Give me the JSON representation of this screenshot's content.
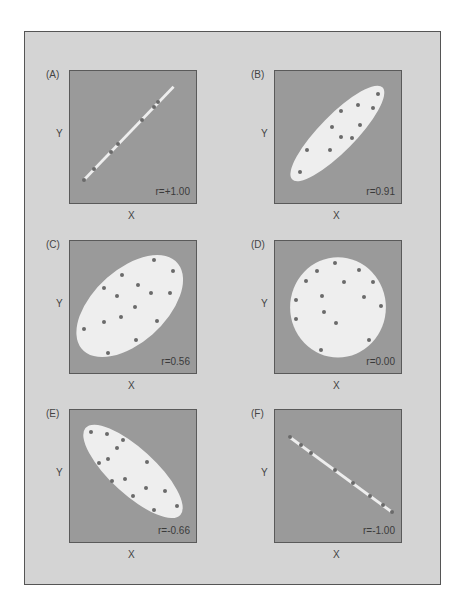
{
  "figure": {
    "colors": {
      "frame_bg": "#d4d4d4",
      "plot_bg": "#9a9a9a",
      "region_fill": "#eeeeee",
      "dot": "#6a6a6a"
    }
  },
  "chart_data": [
    {
      "type": "scatter",
      "panel": "(A)",
      "xlabel": "X",
      "ylabel": "Y",
      "annotation": "r=+1.00",
      "r": 1.0,
      "region": {
        "shape": "line",
        "x1": 11,
        "y1": 82.6,
        "x2": 82.2,
        "y2": 11.9
      },
      "points": [
        [
          11,
          82.6
        ],
        [
          19.4,
          74.1
        ],
        [
          32.7,
          61.2
        ],
        [
          38,
          55.2
        ],
        [
          57.3,
          37.3
        ],
        [
          66.5,
          26.9
        ],
        [
          70.2,
          23.6
        ]
      ]
    },
    {
      "type": "scatter",
      "panel": "(B)",
      "xlabel": "X",
      "ylabel": "Y",
      "annotation": "r=0.91",
      "r": 0.91,
      "region": {
        "shape": "ellipse",
        "cx": 49.5,
        "cy": 47.3,
        "rx": 50,
        "ry": 14,
        "angle": -44
      },
      "points": [
        [
          81.5,
          17.4
        ],
        [
          65.9,
          25.6
        ],
        [
          77.9,
          28.1
        ],
        [
          52.3,
          30.6
        ],
        [
          67.7,
          41
        ],
        [
          45.4,
          42.8
        ],
        [
          52.3,
          50
        ],
        [
          61.3,
          51
        ],
        [
          25.6,
          59.5
        ],
        [
          43.3,
          60
        ],
        [
          20,
          76.4
        ]
      ]
    },
    {
      "type": "scatter",
      "panel": "(C)",
      "xlabel": "X",
      "ylabel": "Y",
      "annotation": "r=0.56",
      "r": 0.56,
      "region": {
        "shape": "ellipse",
        "cx": 47.4,
        "cy": 49.3,
        "rx": 50,
        "ry": 28,
        "angle": -40
      },
      "points": [
        [
          66.4,
          14.7
        ],
        [
          82,
          22.6
        ],
        [
          41.1,
          25.6
        ],
        [
          26.6,
          35.3
        ],
        [
          54.2,
          33.6
        ],
        [
          64.3,
          39.3
        ],
        [
          79.2,
          39.6
        ],
        [
          37,
          42
        ],
        [
          51.8,
          50.2
        ],
        [
          40.4,
          57.2
        ],
        [
          26.8,
          61.4
        ],
        [
          69,
          60.4
        ],
        [
          10.9,
          66.7
        ],
        [
          52.6,
          74.9
        ],
        [
          30.2,
          84.6
        ]
      ]
    },
    {
      "type": "scatter",
      "panel": "(D)",
      "xlabel": "X",
      "ylabel": "Y",
      "annotation": "r=0.00",
      "r": 0.0,
      "region": {
        "shape": "ellipse",
        "cx": 50,
        "cy": 50.3,
        "rx": 38,
        "ry": 38,
        "angle": 0
      },
      "points": [
        [
          47.4,
          16.3
        ],
        [
          66.7,
          21.8
        ],
        [
          33.6,
          22.5
        ],
        [
          24.6,
          30.3
        ],
        [
          54.9,
          31.3
        ],
        [
          77.7,
          30.8
        ],
        [
          37.2,
          41.8
        ],
        [
          71,
          42.3
        ],
        [
          16.9,
          45
        ],
        [
          83.8,
          49.3
        ],
        [
          38.5,
          53.8
        ],
        [
          16.7,
          59.3
        ],
        [
          48.7,
          62.3
        ],
        [
          74.6,
          75.3
        ],
        [
          36.9,
          82.5
        ]
      ]
    },
    {
      "type": "scatter",
      "panel": "(E)",
      "xlabel": "X",
      "ylabel": "Y",
      "annotation": "r=-0.66",
      "r": -0.66,
      "region": {
        "shape": "ellipse",
        "cx": 50,
        "cy": 46.5,
        "rx": 50,
        "ry": 17.5,
        "angle": 41
      },
      "points": [
        [
          16.9,
          17
        ],
        [
          29.4,
          18
        ],
        [
          42.4,
          23
        ],
        [
          37.5,
          28.5
        ],
        [
          29.9,
          37
        ],
        [
          23.4,
          40
        ],
        [
          61.5,
          39.5
        ],
        [
          44,
          52
        ],
        [
          33.6,
          53.8
        ],
        [
          60.7,
          59
        ],
        [
          75,
          61.5
        ],
        [
          49.7,
          65.3
        ],
        [
          84.9,
          72.5
        ],
        [
          66.7,
          75.5
        ]
      ]
    },
    {
      "type": "scatter",
      "panel": "(F)",
      "xlabel": "X",
      "ylabel": "Y",
      "annotation": "r=-1.00",
      "r": -1.0,
      "region": {
        "shape": "line",
        "x1": 11.2,
        "y1": 20.3,
        "x2": 93,
        "y2": 77.5
      },
      "points": [
        [
          11.7,
          20.3
        ],
        [
          20.7,
          26.5
        ],
        [
          28.8,
          32.8
        ],
        [
          47.9,
          45.5
        ],
        [
          62.2,
          55.5
        ],
        [
          75.4,
          65.3
        ],
        [
          85.5,
          72.3
        ],
        [
          93,
          77.5
        ]
      ]
    }
  ]
}
